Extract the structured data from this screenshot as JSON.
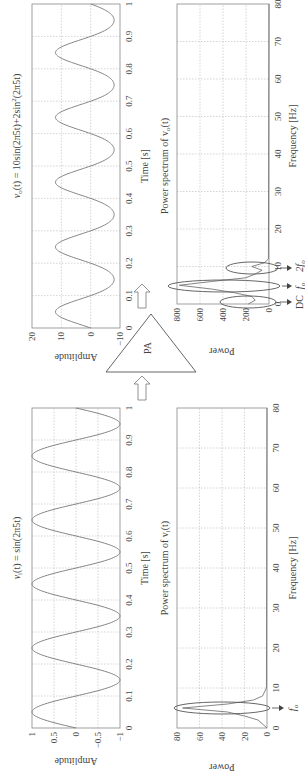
{
  "figure": {
    "orientation": "rotated 90 degrees counter-clockwise",
    "amplifier_label": "PA",
    "input_time": {
      "title": "v_i(t) = sin(2π5t)",
      "title_parts": {
        "lhs": "v",
        "sub": "i",
        "rest": "(t) = sin(2π5t)"
      },
      "xlabel": "Time [s]",
      "ylabel": "Amplitude",
      "xticks": [
        "0",
        "0.1",
        "0.2",
        "0.3",
        "0.4",
        "0.5",
        "0.6",
        "0.7",
        "0.8",
        "0.9",
        "1"
      ],
      "yticks": [
        "1",
        "0.5",
        "0",
        "−0.5",
        "−1"
      ]
    },
    "output_time": {
      "title": "v_o(t) = 10sin(2π5t)+2sin²(2π5t)",
      "title_parts": {
        "lhs": "v",
        "sub": "o",
        "rest": "(t) = 10sin(2π5t)+2sin",
        "sup": "2",
        "tail": "(2π5t)"
      },
      "xlabel": "Time [s]",
      "ylabel": "Amplitude",
      "xticks": [
        "0",
        "0.1",
        "0.2",
        "0.3",
        "0.4",
        "0.5",
        "0.6",
        "0.7",
        "0.8",
        "0.9",
        "1"
      ],
      "yticks": [
        "20",
        "10",
        "0",
        "−10"
      ]
    },
    "input_spectrum": {
      "title": "Power spectrum of v_i(t)",
      "title_parts": {
        "lhs": "Power spectrum of v",
        "sub": "i",
        "rest": "(t)"
      },
      "xlabel": "Frequency [Hz]",
      "ylabel": "Power",
      "xticks": [
        "0",
        "10",
        "20",
        "30",
        "40",
        "50",
        "60",
        "70",
        "80"
      ],
      "yticks": [
        "80",
        "60",
        "40",
        "20",
        "0"
      ],
      "annotations": [
        {
          "label": "f_o",
          "text": "f",
          "sub": "o"
        }
      ]
    },
    "output_spectrum": {
      "title": "Power spectrum of v_o(t)",
      "title_parts": {
        "lhs": "Power spectrum of v",
        "sub": "o",
        "rest": "(t)"
      },
      "xlabel": "Frequency [Hz]",
      "ylabel": "Power",
      "xticks": [
        "0",
        "10",
        "20",
        "30",
        "40",
        "50",
        "60",
        "70",
        "80"
      ],
      "yticks": [
        "800",
        "600",
        "400",
        "200",
        "0"
      ],
      "annotations": [
        {
          "label": "DC",
          "text": "DC",
          "sub": ""
        },
        {
          "label": "f_o",
          "text": "f",
          "sub": "o"
        },
        {
          "label": "2f_o",
          "text": "2f",
          "sub": "o"
        }
      ]
    }
  },
  "chart_data": [
    {
      "type": "line",
      "title": "v_i(t) = sin(2π5t)",
      "xlabel": "Time [s]",
      "ylabel": "Amplitude",
      "xlim": [
        0,
        1
      ],
      "ylim": [
        -1,
        1
      ],
      "grid": true,
      "series": [
        {
          "name": "v_i(t)",
          "expression": "sin(2*pi*5*t)",
          "frequency_hz": 5,
          "amplitude": 1
        }
      ]
    },
    {
      "type": "line",
      "title": "v_o(t) = 10sin(2π5t)+2sin²(2π5t)",
      "xlabel": "Time [s]",
      "ylabel": "Amplitude",
      "xlim": [
        0,
        1
      ],
      "ylim": [
        -10,
        20
      ],
      "grid": true,
      "series": [
        {
          "name": "v_o(t)",
          "expression": "10*sin(2*pi*5*t)+2*sin(2*pi*5*t)^2",
          "max": 12,
          "min": -8
        }
      ]
    },
    {
      "type": "line",
      "title": "Power spectrum of v_i(t)",
      "xlabel": "Frequency [Hz]",
      "ylabel": "Power",
      "xlim": [
        0,
        80
      ],
      "ylim": [
        0,
        80
      ],
      "grid": true,
      "series": [
        {
          "name": "spectrum",
          "x": [
            0,
            2,
            3,
            4,
            5,
            6,
            7,
            8,
            10,
            80
          ],
          "values": [
            0,
            8,
            20,
            35,
            75,
            35,
            12,
            4,
            0.5,
            0
          ]
        }
      ],
      "annotations": [
        {
          "text": "f_o",
          "x": 5
        }
      ]
    },
    {
      "type": "line",
      "title": "Power spectrum of v_o(t)",
      "xlabel": "Frequency [Hz]",
      "ylabel": "Power",
      "xlim": [
        0,
        80
      ],
      "ylim": [
        0,
        800
      ],
      "grid": true,
      "series": [
        {
          "name": "spectrum",
          "x": [
            0,
            1,
            2,
            3,
            4,
            5,
            6,
            7,
            8,
            9,
            10,
            11,
            12,
            80
          ],
          "values": [
            180,
            120,
            150,
            300,
            500,
            780,
            500,
            200,
            120,
            60,
            150,
            40,
            5,
            0
          ]
        }
      ],
      "annotations": [
        {
          "text": "DC",
          "x": 0
        },
        {
          "text": "f_o",
          "x": 5
        },
        {
          "text": "2f_o",
          "x": 10
        }
      ]
    }
  ]
}
